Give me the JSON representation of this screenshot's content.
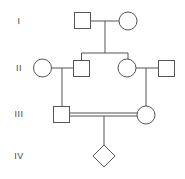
{
  "diagram": {
    "type": "pedigree",
    "generations": [
      {
        "label": "I",
        "y": 21
      },
      {
        "label": "II",
        "y": 68
      },
      {
        "label": "III",
        "y": 114
      },
      {
        "label": "IV",
        "y": 156
      }
    ],
    "individuals": [
      {
        "id": "I-1",
        "sex": "male",
        "shape": "square"
      },
      {
        "id": "I-2",
        "sex": "female",
        "shape": "circle"
      },
      {
        "id": "II-1",
        "sex": "female",
        "shape": "circle"
      },
      {
        "id": "II-2",
        "sex": "male",
        "shape": "square"
      },
      {
        "id": "II-3",
        "sex": "female",
        "shape": "circle"
      },
      {
        "id": "II-4",
        "sex": "male",
        "shape": "square"
      },
      {
        "id": "III-1",
        "sex": "male",
        "shape": "square"
      },
      {
        "id": "III-2",
        "sex": "female",
        "shape": "circle"
      },
      {
        "id": "IV-1",
        "sex": "unknown",
        "shape": "diamond"
      }
    ],
    "relationships": [
      {
        "type": "mating",
        "partners": [
          "I-1",
          "I-2"
        ]
      },
      {
        "type": "mating",
        "partners": [
          "II-1",
          "II-2"
        ]
      },
      {
        "type": "mating",
        "partners": [
          "II-3",
          "II-4"
        ]
      },
      {
        "type": "consanguineous-mating",
        "partners": [
          "III-1",
          "III-2"
        ]
      }
    ],
    "colors": {
      "stroke": "#555555",
      "background": "#ffffff",
      "label": "#444444"
    }
  }
}
